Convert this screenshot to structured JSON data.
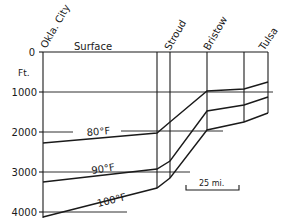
{
  "diagram": {
    "axis": {
      "unit_label": "Ft.",
      "ticks": [
        {
          "label": "0",
          "y": 52
        },
        {
          "label": "1000",
          "y": 92
        },
        {
          "label": "2000",
          "y": 132
        },
        {
          "label": "3000",
          "y": 172
        },
        {
          "label": "4000",
          "y": 212
        }
      ]
    },
    "surface_label": "Surface",
    "locations": [
      {
        "name": "Okla. City",
        "x": 43
      },
      {
        "name": "Stroud",
        "x": 170
      },
      {
        "name": "Bristow",
        "x": 207
      },
      {
        "name": "Tulsa",
        "x": 268
      }
    ],
    "isotherms": [
      {
        "label": "80°F",
        "points": "43,143 157,133 170,122 207,91 244,89 268,82"
      },
      {
        "label": "90°F",
        "points": "43,182 157,169 170,161 207,111 244,105 268,97"
      },
      {
        "label": "100°F",
        "points": "43,217 157,188 170,178 207,130 244,122 268,113"
      }
    ],
    "scale_bar": {
      "label": "25 mi."
    }
  }
}
